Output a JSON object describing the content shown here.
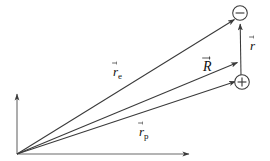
{
  "figure": {
    "background_color": "#ffffff",
    "stroke_color": "#3a3a3a",
    "text_color": "#111111",
    "width": 270,
    "height": 161
  },
  "axes": {
    "origin": {
      "x": 17,
      "y": 154
    },
    "vertical_axis": {
      "x1": 17,
      "y1": 154,
      "x2": 17,
      "y2": 93,
      "arrow": "up"
    },
    "horizontal_axis": {
      "x1": 17,
      "y1": 154,
      "x2": 190,
      "y2": 154,
      "arrow": "right"
    }
  },
  "charges": [
    {
      "name": "negative-charge",
      "symbol": "−",
      "cx": 240,
      "cy": 13,
      "r": 7.5
    },
    {
      "name": "positive-charge",
      "symbol": "+",
      "cx": 242,
      "cy": 82,
      "r": 7.5
    }
  ],
  "vectors": [
    {
      "name": "r-electron",
      "label": "r",
      "subscript": "e",
      "x1": 17,
      "y1": 154,
      "x2": 237,
      "y2": 18,
      "label_x": 113,
      "label_y": 63
    },
    {
      "name": "r-center",
      "label": "R",
      "subscript": "",
      "x1": 17,
      "y1": 154,
      "x2": 240,
      "y2": 62,
      "label_x": 203,
      "label_y": 58
    },
    {
      "name": "r-proton",
      "label": "r",
      "subscript": "p",
      "x1": 17,
      "y1": 154,
      "x2": 238,
      "y2": 82,
      "label_x": 139,
      "label_y": 123
    },
    {
      "name": "r-separation",
      "label": "r",
      "subscript": "",
      "x1": 241,
      "y1": 76,
      "x2": 240,
      "y2": 22,
      "label_x": 250,
      "label_y": 37
    }
  ]
}
